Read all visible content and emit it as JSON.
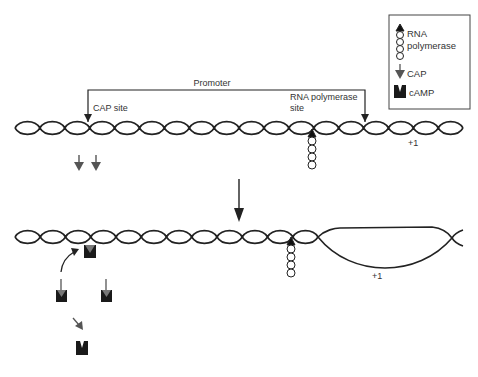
{
  "diagram": {
    "type": "lac-operon-cap-activation",
    "labels": {
      "promoter": "Promoter",
      "cap_site": "CAP site",
      "rna_polymerase_site_line1": "RNA polymerase",
      "rna_polymerase_site_line2": "site",
      "plus_one_top": "+1",
      "plus_one_bottom": "+1"
    },
    "legend": {
      "items": [
        {
          "icon": "rna-polymerase-icon",
          "label_line1": "RNA",
          "label_line2": "polymerase"
        },
        {
          "icon": "cap-arrow-icon",
          "label": "CAP"
        },
        {
          "icon": "camp-icon",
          "label": "cAMP"
        }
      ]
    },
    "colors": {
      "dna": "#222222",
      "cap": "#555555",
      "camp": "#1a1a1a",
      "text": "#333333",
      "legend_border": "#444444"
    },
    "stages": [
      {
        "name": "before-activation",
        "description": "Free CAP molecules, RNA polymerase bound at polymerase site"
      },
      {
        "name": "after-activation",
        "description": "CAP-cAMP complex bound at CAP site, open transcription bubble"
      }
    ]
  }
}
